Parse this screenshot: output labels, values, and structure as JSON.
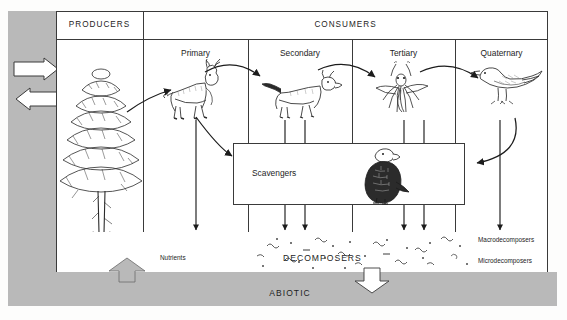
{
  "diagram": {
    "abiotic_label": "ABIOTIC",
    "columns": {
      "producers": "PRODUCERS",
      "consumers": "CONSUMERS"
    },
    "consumer_levels": [
      {
        "label": "Primary",
        "organism": "deer-icon"
      },
      {
        "label": "Secondary",
        "organism": "fox-icon"
      },
      {
        "label": "Tertiary",
        "organism": "mosquito-icon"
      },
      {
        "label": "Quaternary",
        "organism": "bird-icon"
      }
    ],
    "producer_organism": "conifer-tree-icon",
    "scavengers": {
      "label": "Scavengers",
      "organism": "vulture-icon"
    },
    "decomposers": {
      "label": "DECOMPOSERS",
      "callouts": [
        {
          "label": "Macrodecomposers"
        },
        {
          "label": "Microdecomposers"
        }
      ]
    },
    "nutrients_label": "Nutrients",
    "caption": "",
    "colors": {
      "abiotic_fill": "#b9b9b9",
      "line": "#3a3a3a",
      "biotic_fill": "#ffffff",
      "text": "#1d1d1d"
    }
  }
}
